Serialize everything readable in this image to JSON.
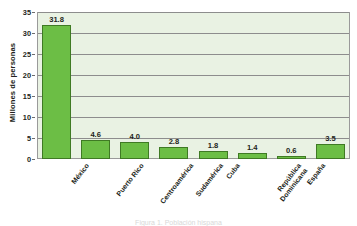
{
  "chart_data": {
    "type": "bar",
    "title": "",
    "xlabel": "",
    "ylabel": "Millones de personas",
    "ylim": [
      0,
      35
    ],
    "yticks": [
      0,
      5,
      10,
      15,
      20,
      25,
      30,
      35
    ],
    "grid": true,
    "legend": null,
    "categories": [
      "México",
      "Puerto Rico",
      "Centroamérica",
      "Sudamérica",
      "Cuba",
      "República Dominicana",
      "España",
      "Otros (hispano o latino)"
    ],
    "category_lines": [
      [
        "México"
      ],
      [
        "Puerto Rico"
      ],
      [
        "Centroamérica"
      ],
      [
        "Sudamérica"
      ],
      [
        "Cuba"
      ],
      [
        "República",
        "Dominicana"
      ],
      [
        "España"
      ],
      [
        "Otros",
        "(hispano o latino)"
      ]
    ],
    "values": [
      31.8,
      4.6,
      4.0,
      2.8,
      1.8,
      1.4,
      0.6,
      3.5
    ],
    "value_labels": [
      "31.8",
      "4.6",
      "4.0",
      "2.8",
      "1.8",
      "1.4",
      "0.6",
      "3.5"
    ],
    "colors": {
      "bar_fill": "#6cbe45",
      "bar_stroke": "#3f7a24",
      "plot_background": "#e9f2e3",
      "gridline": "#8d8d8d",
      "frame": "#9a9a9a",
      "text": "#231f20"
    }
  },
  "caption": {
    "text": "Figura 1. Población hispana"
  }
}
